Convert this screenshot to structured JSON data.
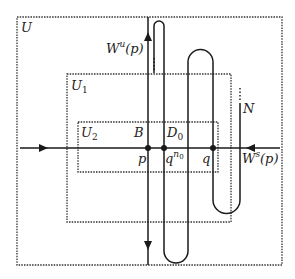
{
  "diagram": {
    "regions": [
      {
        "id": "U",
        "label": "U"
      },
      {
        "id": "U1",
        "label": "U",
        "sub": "1"
      },
      {
        "id": "U2",
        "label": "U",
        "sub": "2"
      }
    ],
    "labels": {
      "unstable_manifold": {
        "main": "W",
        "sup": "u",
        "arg": "(p)"
      },
      "stable_manifold": {
        "main": "W",
        "sup": "s",
        "arg": "(p)"
      },
      "box_B": "B",
      "box_D0": {
        "main": "D",
        "sub": "0"
      },
      "point_p": "p",
      "point_qn0": {
        "main": "q",
        "sup": "n",
        "supsub": "0"
      },
      "point_q": "q",
      "curve_N": "N"
    },
    "colors": {
      "line": "#1a1a1a",
      "dotted_box": "#333333",
      "background": "#ffffff"
    }
  }
}
